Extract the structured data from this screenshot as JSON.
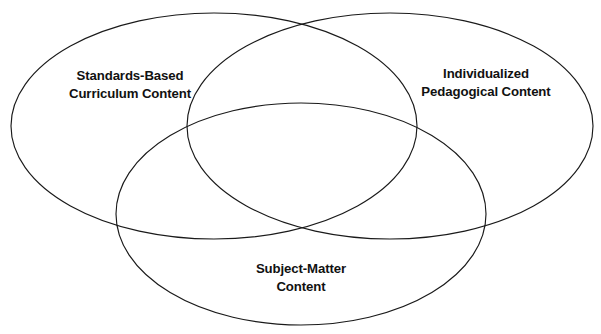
{
  "figure": {
    "type": "venn-diagram-3-set",
    "background_color": "#ffffff",
    "stroke_color": "#1a1a1a",
    "text_color": "#111111",
    "width": 601,
    "height": 334
  },
  "sets": [
    {
      "id": "standards-based-curriculum-content",
      "label_line1": "Standards-Based",
      "label_line2": "Curriculum Content",
      "position": "top-left"
    },
    {
      "id": "individualized-pedagogical-content",
      "label_line1": "Individualized",
      "label_line2": "Pedagogical Content",
      "position": "top-right"
    },
    {
      "id": "subject-matter-content",
      "label_line1": "Subject-Matter",
      "label_line2": "Content",
      "position": "bottom-center"
    }
  ],
  "top_crop_remnant": {
    "text": "· ·  ·   ·    ·  ·"
  }
}
